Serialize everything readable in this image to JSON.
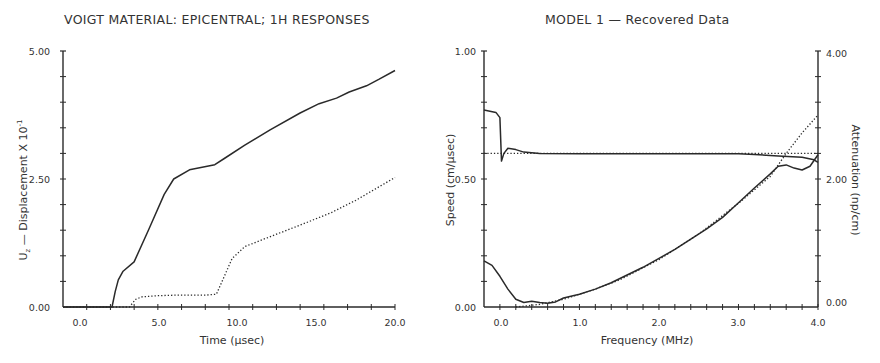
{
  "chart_data": [
    {
      "type": "line",
      "title": "VOIGT MATERIAL: EPICENTRAL; 1H  RESPONSES",
      "xlabel": "Time (μsec)",
      "ylabel": "U_z — Displacement X 10⁻¹",
      "xlim": [
        -1.0,
        20.0
      ],
      "ylim": [
        0.0,
        5.0
      ],
      "x_ticks": [
        "0.0",
        "5.0",
        "10.0",
        "15.0",
        "20.0"
      ],
      "y_ticks": [
        "0.00",
        "2.50",
        "5.00"
      ],
      "grid": false,
      "legend": null,
      "series": [
        {
          "name": "solid",
          "style": "solid",
          "x": [
            -1.0,
            2.1,
            2.3,
            2.5,
            2.8,
            3.5,
            4.4,
            5.4,
            6.0,
            7.0,
            8.6,
            9.2,
            10.5,
            12.1,
            14.0,
            15.2,
            16.3,
            17.1,
            18.2,
            19.0,
            20.0
          ],
          "y": [
            0.0,
            0.0,
            0.3,
            0.53,
            0.7,
            0.88,
            1.5,
            2.2,
            2.5,
            2.68,
            2.78,
            2.9,
            3.16,
            3.46,
            3.79,
            3.97,
            4.08,
            4.2,
            4.32,
            4.45,
            4.62
          ]
        },
        {
          "name": "dotted",
          "style": "dotted",
          "x": [
            -1.0,
            3.2,
            3.6,
            4.0,
            5.0,
            6.0,
            7.0,
            8.0,
            8.7,
            9.2,
            9.7,
            10.5,
            11.5,
            13.0,
            14.5,
            16.0,
            17.5,
            19.0,
            20.0
          ],
          "y": [
            0.0,
            0.0,
            0.15,
            0.2,
            0.22,
            0.23,
            0.23,
            0.23,
            0.25,
            0.6,
            0.95,
            1.18,
            1.3,
            1.48,
            1.66,
            1.85,
            2.08,
            2.35,
            2.53
          ]
        }
      ]
    },
    {
      "type": "line",
      "title": "MODEL 1 —  Recovered Data",
      "xlabel": "Frequency (MHz)",
      "ylabel": "Speed (cm/μsec)",
      "y2label": "Attenuation (np/cm)",
      "xlim": [
        -0.2,
        4.0
      ],
      "ylim": [
        0.0,
        1.0
      ],
      "y2lim": [
        0.0,
        4.0
      ],
      "x_ticks": [
        "0.0",
        "1.0",
        "2.0",
        "3.0",
        "4.0"
      ],
      "y_ticks": [
        "0.00",
        "0.50",
        "1.00"
      ],
      "y2_ticks": [
        "0.00",
        "2.00",
        "4.00"
      ],
      "grid": false,
      "legend": null,
      "series": [
        {
          "name": "speed-recovered",
          "axis": "left",
          "style": "solid",
          "x": [
            -0.2,
            -0.05,
            0.0,
            0.02,
            0.05,
            0.1,
            0.2,
            0.3,
            0.5,
            1.0,
            2.0,
            3.0,
            3.2,
            3.5,
            3.8,
            3.95,
            4.0
          ],
          "y": [
            0.77,
            0.76,
            0.74,
            0.57,
            0.6,
            0.62,
            0.615,
            0.605,
            0.6,
            0.599,
            0.599,
            0.599,
            0.596,
            0.59,
            0.585,
            0.575,
            0.565
          ]
        },
        {
          "name": "speed-true",
          "axis": "left",
          "style": "dotted",
          "x": [
            -0.2,
            4.0
          ],
          "y": [
            0.6,
            0.6
          ]
        },
        {
          "name": "attenuation-recovered",
          "axis": "right",
          "style": "solid",
          "x": [
            -0.2,
            -0.1,
            0.0,
            0.1,
            0.2,
            0.3,
            0.4,
            0.5,
            0.6,
            0.7,
            0.8,
            1.0,
            1.2,
            1.4,
            1.6,
            1.8,
            2.0,
            2.2,
            2.4,
            2.6,
            2.8,
            3.0,
            3.2,
            3.4,
            3.5,
            3.6,
            3.7,
            3.8,
            3.9,
            4.0
          ],
          "y": [
            0.72,
            0.65,
            0.48,
            0.28,
            0.12,
            0.07,
            0.09,
            0.07,
            0.06,
            0.08,
            0.14,
            0.2,
            0.28,
            0.38,
            0.5,
            0.62,
            0.76,
            0.9,
            1.06,
            1.22,
            1.4,
            1.63,
            1.86,
            2.08,
            2.2,
            2.22,
            2.17,
            2.14,
            2.2,
            2.38
          ]
        },
        {
          "name": "attenuation-true",
          "axis": "right",
          "style": "dotted",
          "x": [
            0.2,
            0.5,
            0.8,
            1.0,
            1.2,
            1.5,
            2.0,
            2.5,
            3.0,
            3.4,
            3.6,
            3.8,
            4.0
          ],
          "y": [
            0.0,
            0.04,
            0.12,
            0.2,
            0.28,
            0.42,
            0.74,
            1.14,
            1.62,
            2.04,
            2.4,
            2.72,
            3.0
          ]
        }
      ]
    }
  ],
  "left_chart": {
    "title": "VOIGT MATERIAL: EPICENTRAL; 1H  RESPONSES",
    "ylabel_main": "U",
    "ylabel_sub": "z",
    "ylabel_rest": "  —   Displacement  X  10",
    "ylabel_exp": "-1",
    "xlabel": "Time  (μsec)",
    "x_ticks": [
      "0.0",
      "5.0",
      "10.0",
      "15.0",
      "20.0"
    ],
    "y_ticks": [
      "0.00",
      "2.50",
      "5.00"
    ]
  },
  "right_chart": {
    "title": "MODEL 1  —   Recovered Data",
    "ylabel_left": "Speed  (cm/μsec)",
    "ylabel_right": "Attenuation  (np/cm)",
    "xlabel": "Frequency  (MHz)",
    "x_ticks": [
      "0.0",
      "1.0",
      "2.0",
      "3.0",
      "4.0"
    ],
    "y_ticks_left": [
      "0.00",
      "0.50",
      "1.00"
    ],
    "y_ticks_right": [
      "0.00",
      "2.00",
      "4.00"
    ]
  },
  "colors": {
    "line": "#2a2a2a",
    "axis": "#2a2a2a",
    "background": "#ffffff"
  }
}
